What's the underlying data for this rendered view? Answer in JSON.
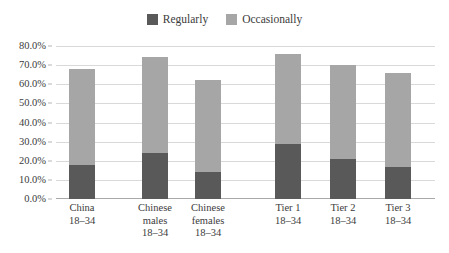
{
  "chart_data": {
    "type": "bar",
    "subtype": "stacked-bar",
    "title": "",
    "xlabel": "",
    "ylabel": "",
    "ylim": [
      0,
      80
    ],
    "ytick_step": 10,
    "ytick_labels": [
      "80.0%",
      "70.0%",
      "60.0%",
      "50.0%",
      "40.0%",
      "30.0%",
      "20.0%",
      "10.0%",
      "0.0%"
    ],
    "ytick_values": [
      80,
      70,
      60,
      50,
      40,
      30,
      20,
      10,
      0
    ],
    "grid": true,
    "legend_position": "top-center",
    "categories": [
      {
        "lines": [
          "China",
          "18–34"
        ]
      },
      {
        "lines": [
          "Chinese",
          "males",
          "18–34"
        ]
      },
      {
        "lines": [
          "Chinese",
          "females",
          "18–34"
        ]
      },
      {
        "lines": [
          "Tier 1",
          "18–34"
        ]
      },
      {
        "lines": [
          "Tier 2",
          "18–34"
        ]
      },
      {
        "lines": [
          "Tier 3",
          "18–34"
        ]
      }
    ],
    "category_labels": [
      "China 18-34",
      "Chinese males 18-34",
      "Chinese females 18-34",
      "Tier 1 18-34",
      "Tier 2 18-34",
      "Tier 3 18-34"
    ],
    "series": [
      {
        "name": "Regularly",
        "color": "#595959",
        "values": [
          18,
          24,
          14,
          29,
          21,
          17
        ]
      },
      {
        "name": "Occasionally",
        "color": "#a6a6a6",
        "values": [
          50,
          50,
          48,
          47,
          49,
          49
        ]
      }
    ],
    "totals": [
      68,
      74,
      62,
      76,
      70,
      66
    ],
    "group_gap_after_index": 2
  },
  "legend": {
    "items": [
      {
        "label": "Regularly",
        "color": "#595959"
      },
      {
        "label": "Occasionally",
        "color": "#a6a6a6"
      }
    ]
  },
  "colors": {
    "regularly": "#595959",
    "occasionally": "#a6a6a6",
    "gridline": "#d9d9d9",
    "axis": "#a9a9a9",
    "text": "#3b3b3b",
    "background": "#ffffff"
  }
}
